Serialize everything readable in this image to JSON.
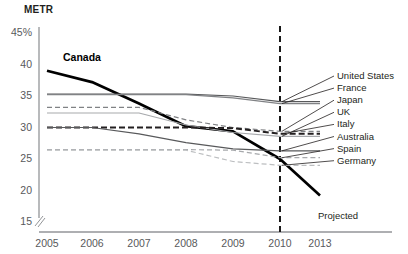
{
  "chart_data": {
    "type": "line",
    "title": "",
    "ylabel": "METR",
    "xlabel": "",
    "ylim": [
      15,
      45
    ],
    "yticks": [
      "45%",
      "40",
      "35",
      "30",
      "25",
      "20",
      "15"
    ],
    "ytick_values": [
      45,
      40,
      35,
      30,
      25,
      20,
      15
    ],
    "axis_break": true,
    "grid": false,
    "legend_position": "right",
    "x": [
      2005,
      2006,
      2007,
      2008,
      2009,
      2010,
      2013
    ],
    "categories": [
      "2005",
      "2006",
      "2007",
      "2008",
      "2009",
      "2010",
      "2013"
    ],
    "annotations": [
      {
        "text": "Projected",
        "x": 2010,
        "note": "vertical dashed divider at 2010"
      },
      {
        "text": "Canada",
        "x": 2006,
        "note": "inline bold series label"
      }
    ],
    "series": [
      {
        "name": "Canada",
        "style": "solid-bold",
        "color": "#000000",
        "values": [
          39.0,
          37.2,
          33.8,
          30.2,
          29.4,
          25.0,
          19.2
        ]
      },
      {
        "name": "United States",
        "style": "solid-thin",
        "color": "#58595b",
        "values": [
          35.3,
          35.3,
          35.3,
          35.3,
          35.0,
          34.1,
          34.1
        ]
      },
      {
        "name": "France",
        "style": "solid-thin",
        "color": "#808285",
        "values": [
          35.2,
          35.2,
          35.2,
          35.2,
          34.7,
          33.8,
          33.8
        ]
      },
      {
        "name": "Japan",
        "style": "dashed",
        "color": "#808285",
        "values": [
          33.2,
          33.2,
          33.2,
          31.2,
          30.0,
          29.4,
          29.4
        ]
      },
      {
        "name": "UK",
        "style": "solid-thin",
        "color": "#a7a9ac",
        "values": [
          32.3,
          32.3,
          32.3,
          30.4,
          29.2,
          28.6,
          28.6
        ]
      },
      {
        "name": "Italy",
        "style": "dashed-bold",
        "color": "#231f20",
        "values": [
          30.0,
          30.0,
          30.0,
          30.0,
          29.9,
          29.0,
          29.0
        ]
      },
      {
        "name": "Australia",
        "style": "solid-thin",
        "color": "#58595b",
        "values": [
          30.0,
          30.0,
          29.0,
          27.6,
          26.6,
          26.3,
          26.3
        ]
      },
      {
        "name": "Spain",
        "style": "dashed",
        "color": "#a7a9ac",
        "values": [
          26.5,
          26.5,
          26.5,
          26.5,
          26.4,
          25.2,
          25.2
        ]
      },
      {
        "name": "Germany",
        "style": "dashed",
        "color": "#bcbec0",
        "values": [
          26.4,
          26.4,
          26.4,
          26.4,
          24.6,
          24.0,
          24.0
        ]
      }
    ],
    "legend_entries": [
      "United States",
      "France",
      "Japan",
      "UK",
      "Italy",
      "Australia",
      "Spain",
      "Germany"
    ]
  },
  "labels": {
    "canada": "Canada",
    "projected": "Projected",
    "metr": "METR"
  }
}
